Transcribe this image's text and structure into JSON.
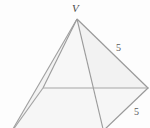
{
  "figure": {
    "type": "geometry-diagram",
    "background_color": "#fdfdfd",
    "stroke_color": "#9a9a9a",
    "fill_color_light": "#fbfbfb",
    "fill_color_shade": "#f4f4f4",
    "label_color": "#4a4a4a",
    "width": 150,
    "height": 128
  },
  "labels": {
    "apex": "V",
    "edge_lateral_right": "5",
    "edge_base_right": "5"
  },
  "geometry": {
    "apex": {
      "x": 77,
      "y": 19
    },
    "base_left": {
      "x": 43,
      "y": 88
    },
    "base_right": {
      "x": 148,
      "y": 88
    },
    "base_front": {
      "x": 103,
      "y": 131
    },
    "base_back_offscreen": {
      "x": 10,
      "y": 134
    },
    "edges": [
      {
        "name": "apex-to-base-left",
        "from": "apex",
        "to": "base_left"
      },
      {
        "name": "apex-to-base-right",
        "from": "apex",
        "to": "base_right"
      },
      {
        "name": "apex-to-base-front",
        "from": "apex",
        "to": "base_front"
      },
      {
        "name": "apex-to-base-back",
        "from": "apex",
        "to": "base_back_offscreen"
      },
      {
        "name": "base-left-to-base-right",
        "from": "base_left",
        "to": "base_right"
      },
      {
        "name": "base-left-to-base-back",
        "from": "base_left",
        "to": "base_back_offscreen"
      },
      {
        "name": "base-right-to-base-front",
        "from": "base_right",
        "to": "base_front"
      }
    ]
  }
}
